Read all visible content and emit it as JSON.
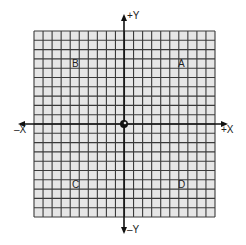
{
  "diagram": {
    "type": "coordinate-grid",
    "grid": {
      "columns": 20,
      "rows": 20,
      "cell_fill": "#e6e6e6",
      "line_color": "#3a3a3a"
    },
    "axes": {
      "pos_y_label": "+Y",
      "neg_y_label": "–Y",
      "pos_x_label": "+X",
      "neg_x_label": "–X",
      "axis_color": "#111111"
    },
    "origin_marker": "circle",
    "points": [
      {
        "label": "A",
        "quadrant": "I"
      },
      {
        "label": "B",
        "quadrant": "II"
      },
      {
        "label": "C",
        "quadrant": "III"
      },
      {
        "label": "D",
        "quadrant": "IV"
      }
    ]
  }
}
